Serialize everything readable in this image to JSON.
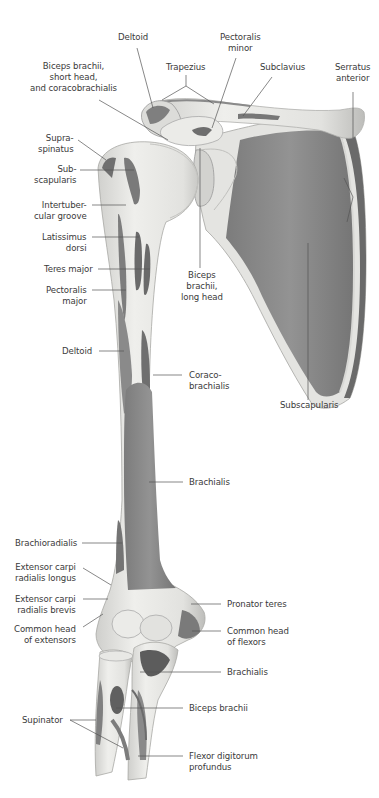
{
  "figure": {
    "colors": {
      "background": "#ffffff",
      "bone": "#e6e6e3",
      "bone_shadow": "#c9c9c6",
      "muscle_attachment": "#8c8c8c",
      "muscle_dark": "#6e6e6e",
      "leader_line": "#555555",
      "label_text": "#3a3a3a"
    }
  },
  "labels": {
    "deltoid_top": "Deltoid",
    "pectoralis_minor": "Pectoralis\nminor",
    "trapezius": "Trapezius",
    "subclavius": "Subclavius",
    "serratus_anterior": "Serratus\nanterior",
    "biceps_short_head": "Biceps brachii,\nshort head,\nand coracobrachialis",
    "supraspinatus": "Supra-\nspinatus",
    "subscapularis_humerus": "Sub-\nscapularis",
    "intertubercular_groove": "Intertuber-\ncular groove",
    "latissimus_dorsi": "Latissimus\ndorsi",
    "teres_major": "Teres major",
    "pectoralis_major": "Pectoralis\nmajor",
    "biceps_long_head": "Biceps\nbrachii,\nlong head",
    "deltoid_mid": "Deltoid",
    "coracobrachialis": "Coraco-\nbrachialis",
    "subscapularis_scapula": "Subscapularis",
    "brachialis_humerus": "Brachialis",
    "brachioradialis": "Brachioradialis",
    "ecr_longus": "Extensor carpi\nradialis longus",
    "ecr_brevis": "Extensor carpi\nradialis brevis",
    "common_head_extensors": "Common head\nof extensors",
    "pronator_teres": "Pronator teres",
    "common_head_flexors": "Common head\nof flexors",
    "brachialis_ulna": "Brachialis",
    "biceps_brachii": "Biceps brachii",
    "supinator": "Supinator",
    "flexor_digitorum_profundus": "Flexor digitorum\nprofundus"
  }
}
